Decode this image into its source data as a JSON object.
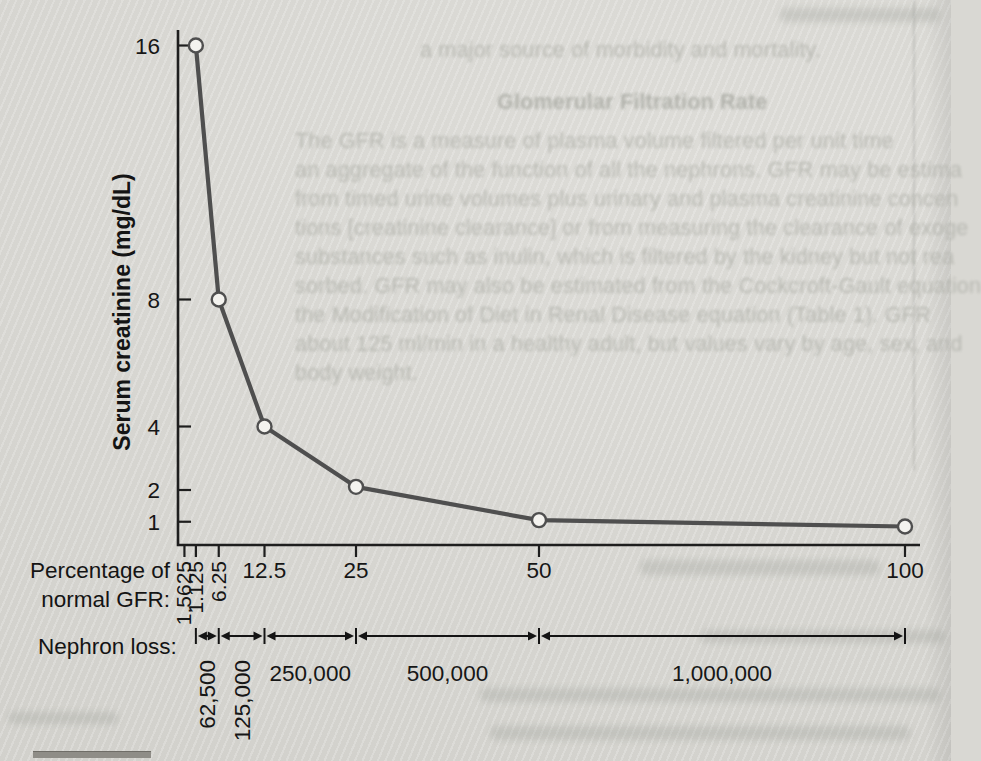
{
  "figure": {
    "ylabel": "Serum creatinine (mg/dL)",
    "xlabel_line1": "Percentage of",
    "xlabel_line2": "normal GFR:",
    "nephron_label": "Nephron loss:"
  },
  "chart_data": {
    "type": "line",
    "title": "",
    "xlabel": "Percentage of normal GFR",
    "ylabel": "Serum creatinine (mg/dL)",
    "x": [
      3.125,
      6.25,
      12.5,
      25,
      50,
      100
    ],
    "values": [
      16,
      8,
      4,
      2.1,
      1.05,
      0.85
    ],
    "x_ticks": [
      {
        "value": 1.5625,
        "label": "1.5625",
        "rotated": true
      },
      {
        "value": 3.125,
        "label": "1.125",
        "rotated": true
      },
      {
        "value": 6.25,
        "label": "6.25",
        "rotated": true
      },
      {
        "value": 12.5,
        "label": "12.5",
        "rotated": false
      },
      {
        "value": 25,
        "label": "25",
        "rotated": false
      },
      {
        "value": 50,
        "label": "50",
        "rotated": false
      },
      {
        "value": 100,
        "label": "100",
        "rotated": false
      }
    ],
    "y_ticks": [
      16,
      8,
      4,
      2,
      1
    ],
    "xlim": [
      0,
      102
    ],
    "ylim": [
      0,
      16.5
    ],
    "grid": false,
    "legend": null,
    "marker": "open-circle",
    "line_color": "#4f4f4f",
    "annotations": {
      "nephron_loss": {
        "label": "Nephron loss:",
        "segments": [
          {
            "from": 3.125,
            "to": 6.25,
            "label": "62,500",
            "rotated": true
          },
          {
            "from": 6.25,
            "to": 12.5,
            "label": "125,000",
            "rotated": true
          },
          {
            "from": 12.5,
            "to": 25,
            "label": "250,000",
            "rotated": false
          },
          {
            "from": 25,
            "to": 50,
            "label": "500,000",
            "rotated": false
          },
          {
            "from": 50,
            "to": 100,
            "label": "1,000,000",
            "rotated": false
          }
        ]
      }
    }
  },
  "bleedthrough": {
    "lines": [
      "a major source of morbidity and mortality.",
      "Glomerular Filtration Rate",
      "The GFR is a measure of plasma volume filtered per unit time",
      "an aggregate of the function of all the nephrons. GFR may be estima",
      "from timed urine volumes plus urinary and plasma creatinine concen",
      "tions [creatinine clearance] or from measuring the clearance of exoge",
      "substances such as inulin, which is filtered by the kidney but not rea",
      "sorbed. GFR may also be estimated from the Cockcroft-Gault equation",
      "the Modification of Diet in Renal Disease equation (Table 1). GFR",
      "about 125 ml/min in a healthy adult, but values vary by age, sex, and",
      "body weight."
    ]
  }
}
